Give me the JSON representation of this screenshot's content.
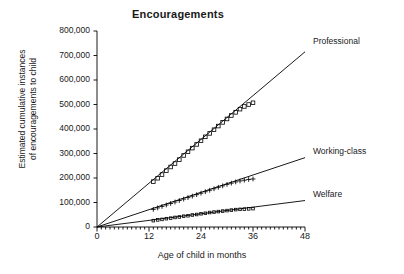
{
  "chart_data": {
    "type": "scatter",
    "title": "Encouragements",
    "xlabel": "Age of child in months",
    "ylabel_line1": "Estimated cumulative instances",
    "ylabel_line2": "of encouragements to child",
    "xlim": [
      0,
      48
    ],
    "ylim": [
      0,
      800000
    ],
    "xticks": [
      0,
      12,
      24,
      36,
      48
    ],
    "xtick_labels": [
      "0",
      "12",
      "24",
      "36",
      "48"
    ],
    "yticks": [
      0,
      100000,
      200000,
      300000,
      400000,
      500000,
      600000,
      700000,
      800000
    ],
    "ytick_labels": [
      "0",
      "100,000",
      "200,000",
      "300,000",
      "400,000",
      "500,000",
      "600,000",
      "700,000",
      "800,000"
    ],
    "grid": false,
    "legend_position": "right-inline-annotations",
    "x_minor_ticks": true,
    "series": [
      {
        "name": "Professional",
        "label": "Professional",
        "marker": "open-square",
        "color": "#000000",
        "trendline": {
          "x0": 0,
          "y0": 0,
          "x1": 48,
          "y1": 715000,
          "slope_per_month": 14896
        },
        "x": [
          13,
          14,
          15,
          16,
          17,
          18,
          19,
          20,
          21,
          22,
          23,
          24,
          25,
          26,
          27,
          28,
          29,
          30,
          31,
          32,
          33,
          34,
          35,
          36
        ],
        "y": [
          185000,
          199000,
          214000,
          230000,
          245000,
          259000,
          275000,
          292000,
          307000,
          322000,
          337000,
          352000,
          368000,
          382000,
          397000,
          412000,
          427000,
          441000,
          455000,
          468000,
          481000,
          492000,
          500000,
          507000
        ]
      },
      {
        "name": "Working-class",
        "label": "Working-class",
        "marker": "plus",
        "color": "#000000",
        "trendline": {
          "x0": 0,
          "y0": 0,
          "x1": 48,
          "y1": 283000,
          "slope_per_month": 5896
        },
        "x": [
          13,
          14,
          15,
          16,
          17,
          18,
          19,
          20,
          21,
          22,
          23,
          24,
          25,
          26,
          27,
          28,
          29,
          30,
          31,
          32,
          33,
          34,
          35,
          36
        ],
        "y": [
          72000,
          78000,
          84000,
          90000,
          96000,
          102000,
          108000,
          114000,
          120000,
          126000,
          132000,
          138000,
          144000,
          150000,
          156000,
          162000,
          168000,
          174000,
          179000,
          184000,
          188000,
          191000,
          194000,
          196000
        ]
      },
      {
        "name": "Welfare",
        "label": "Welfare",
        "marker": "small-square",
        "color": "#000000",
        "trendline": {
          "x0": 0,
          "y0": 0,
          "x1": 48,
          "y1": 108000,
          "slope_per_month": 2250
        },
        "x": [
          13,
          14,
          15,
          16,
          17,
          18,
          19,
          20,
          21,
          22,
          23,
          24,
          25,
          26,
          27,
          28,
          29,
          30,
          31,
          32,
          33,
          34,
          35,
          36
        ],
        "y": [
          26000,
          29000,
          31000,
          34000,
          36000,
          39000,
          41000,
          44000,
          46000,
          49000,
          51000,
          54000,
          56000,
          59000,
          61000,
          63000,
          65000,
          67000,
          69000,
          71000,
          72000,
          73000,
          74000,
          75000
        ]
      }
    ]
  }
}
